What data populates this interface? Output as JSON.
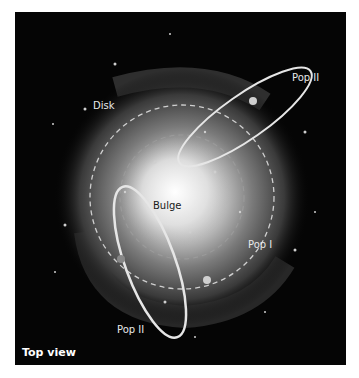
{
  "diagram": {
    "caption": "Top view",
    "labels": {
      "disk": "Disk",
      "bulge": "Bulge",
      "pop1": "Pop I",
      "pop2_top": "Pop II",
      "pop2_bottom": "Pop II"
    },
    "colors": {
      "background": "#050505",
      "orbit": "#e6e6e6",
      "glow": "#ffffff"
    }
  }
}
